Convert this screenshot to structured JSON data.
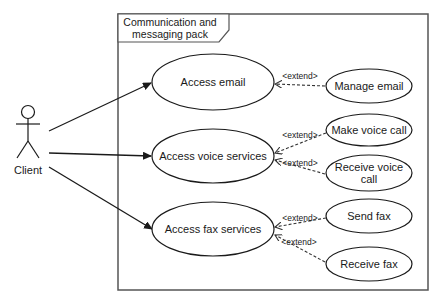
{
  "package": {
    "title_line1": "Communication and",
    "title_line2": "messaging pack"
  },
  "actor": {
    "label": "Client"
  },
  "use_cases": {
    "access_email": "Access email",
    "access_voice": "Access voice services",
    "access_fax": "Access fax services",
    "manage_email": "Manage email",
    "make_voice_call": "Make voice call",
    "receive_voice_call_line1": "Receive voice",
    "receive_voice_call_line2": "call",
    "send_fax": "Send fax",
    "receive_fax": "Receive fax"
  },
  "relations": {
    "extend_label": "<extend>",
    "ext1": "<extend>",
    "ext2": "<extend>",
    "ext3": "<extend>",
    "ext4": "<extend>",
    "ext5": "<extend>"
  },
  "colors": {
    "stroke": "#1a1a1a",
    "package_border": "#555555",
    "background": "#ffffff"
  }
}
